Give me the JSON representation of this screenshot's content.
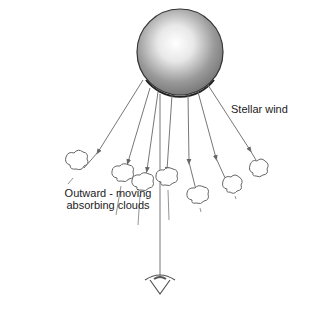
{
  "labels": {
    "stellar_wind": "Stellar wind",
    "clouds_line1": "Outward - moving",
    "clouds_line2": "absorbing clouds"
  },
  "elements": {
    "star": "star-sphere",
    "observer": "eye-icon",
    "clouds_count": 7
  }
}
